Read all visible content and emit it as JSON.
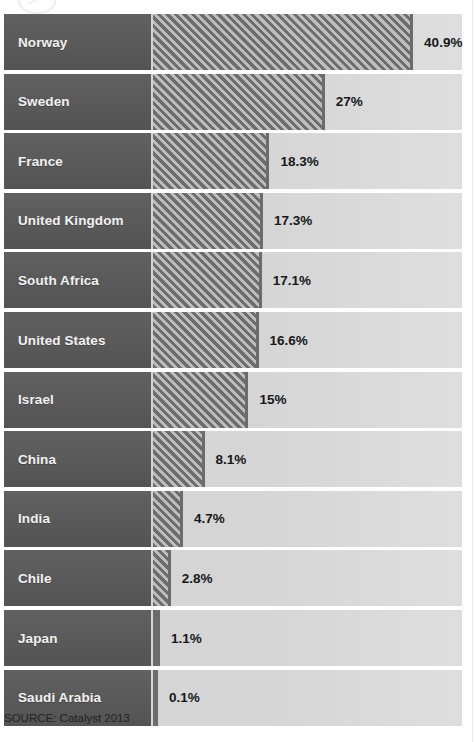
{
  "source_note": "SOURCE: Catalyst 2013",
  "colors": {
    "label_block": "#585858",
    "track": "#d5d5d5",
    "bar_dark": "#6d6d6d",
    "bar_light": "#bdbdbd",
    "label_text": "#f2f2f2",
    "value_text": "#16181a",
    "page_background": "#ffffff"
  },
  "chart_data": {
    "type": "bar",
    "orientation": "horizontal",
    "title": "",
    "subtitle": "",
    "xlabel": "",
    "ylabel": "",
    "value_suffix": "%",
    "xlim": [
      0,
      48
    ],
    "grid": false,
    "legend": "none",
    "sorted": "descending",
    "categories": [
      "Norway",
      "Sweden",
      "France",
      "United Kingdom",
      "South Africa",
      "United States",
      "Israel",
      "China",
      "India",
      "Chile",
      "Japan",
      "Saudi Arabia"
    ],
    "values": [
      40.9,
      27,
      18.3,
      17.3,
      17.1,
      16.6,
      15,
      8.1,
      4.7,
      2.8,
      1.1,
      0.1
    ],
    "value_labels": [
      "40.9%",
      "27%",
      "18.3%",
      "17.3%",
      "17.1%",
      "16.6%",
      "15%",
      "8.1%",
      "4.7%",
      "2.8%",
      "1.1%",
      "0.1%"
    ],
    "annotations": [
      "SOURCE: Catalyst 2013"
    ]
  }
}
